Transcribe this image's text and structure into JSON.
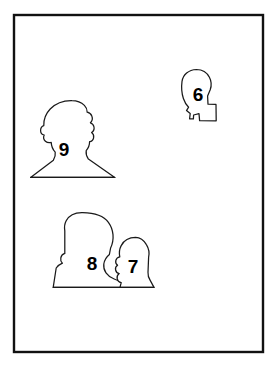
{
  "canvas": {
    "width": 276,
    "height": 366,
    "background_color": "#ffffff",
    "description": "Line-art illustration: four numbered human head-and-shoulder silhouettes inside a rectangular border"
  },
  "frame": {
    "name": "border-frame",
    "x": 14,
    "y": 15,
    "width": 249,
    "height": 337,
    "stroke_color": "#111111",
    "stroke_width": 2.4,
    "fill_color": "#ffffff"
  },
  "style": {
    "outline_color": "#1a1a1a",
    "outline_width": 1.25,
    "fill_color": "#ffffff",
    "label_color": "#000000",
    "label_font_size": 19
  },
  "figures": [
    {
      "id": "figure-6",
      "label": "6",
      "label_x": 198,
      "label_y": 96,
      "orientation": "profile-facing-right",
      "description": "small head in profile facing right, with stepped chin and neck",
      "bbox": {
        "x": 181,
        "y": 69,
        "width": 36,
        "height": 53
      },
      "path": "M 196.5 69.5 C 188.5 69.8 183.0 74.5 182.0 81.5 C 181.2 87.5 181.6 93.0 183.4 98.5 C 184.6 102.2 186.4 105.0 188.6 107.2 L 186.5 110.6 L 190.2 113.6 L 189.6 118.8 L 193.4 118.9 L 193.6 115.0 L 199.0 113.6 L 199.6 120.6 L 216.2 120.8 L 216.0 104.4 L 208.0 104.2 L 207.6 96.0 L 210.2 89.8 C 211.6 86.0 211.4 81.0 209.4 77.2 C 206.8 72.2 202.3 69.6 196.5 69.5 Z"
    },
    {
      "id": "figure-9",
      "label": "9",
      "label_x": 64,
      "label_y": 151,
      "orientation": "front-facing-bust",
      "description": "front-facing head and shoulders with wavy hair outline, flat baseline under shoulders",
      "bbox": {
        "x": 30,
        "y": 100,
        "width": 86,
        "height": 78
      },
      "path": "M 72.0 100.6 C 63.4 100.4 55.6 103.4 50.2 109.0 C 45.6 113.8 43.6 119.4 43.8 125.6 C 42.0 126.2 40.6 128.0 40.6 130.4 C 40.6 132.8 42.2 134.6 44.2 135.0 C 43.2 137.2 43.6 139.6 45.4 141.2 C 47.0 142.6 49.2 143.0 51.2 142.4 C 51.4 146.2 52.8 149.6 55.2 152.2 C 55.6 155.0 55.0 157.8 53.4 160.2 L 30.6 177.4 L 114.8 177.4 L 88.4 159.0 C 86.6 156.6 85.8 153.6 86.2 150.6 C 88.4 148.2 89.6 145.0 89.6 141.6 C 91.6 141.4 93.2 139.8 93.6 137.8 C 94.0 135.8 93.2 133.8 91.6 132.6 C 93.4 131.4 94.4 129.2 94.0 127.0 C 93.6 125.0 92.2 123.4 90.4 122.8 C 92.2 121.0 92.8 118.4 91.8 116.0 C 91.0 114.0 89.2 112.6 87.2 112.2 C 87.2 109.6 86.2 107.2 84.4 105.4 C 81.2 102.2 76.8 100.6 72.0 100.6 Z"
    },
    {
      "id": "figure-8",
      "label": "8",
      "label_x": 92,
      "label_y": 265,
      "orientation": "three-quarter-facing-right",
      "description": "larger head and shoulders, tall rounded head, facing slightly right, sharing baseline with figure 7",
      "bbox": {
        "x": 53,
        "y": 212,
        "width": 70,
        "height": 76
      },
      "path": "M 82.6 212.6 C 75.2 212.4 69.0 215.4 66.2 220.8 C 64.6 223.8 64.2 227.4 64.8 230.8 L 64.8 253.4 C 62.8 254.0 61.2 255.6 60.8 257.8 C 60.4 259.8 61.0 261.8 62.4 263.2 C 60.0 264.2 57.8 265.8 56.2 268.0 L 53.2 287.4 L 122.6 287.4 L 122.2 283.0 C 119.6 281.4 117.0 280.0 114.2 279.0 C 111.0 277.8 108.0 275.6 106.0 272.8 C 104.2 270.2 103.4 267.0 103.8 264.0 C 104.4 260.2 106.4 256.8 109.4 254.4 L 110.6 248.0 C 112.6 243.8 113.4 239.2 113.0 234.6 C 112.6 230.2 111.0 226.0 108.4 222.4 C 104.6 217.0 96.8 212.8 82.6 212.6 Z"
    },
    {
      "id": "figure-7",
      "label": "7",
      "label_x": 133,
      "label_y": 268,
      "orientation": "profile-facing-left",
      "description": "smaller head in profile facing left with wavy facial contour, shares baseline with figure 8",
      "bbox": {
        "x": 114,
        "y": 237,
        "width": 40,
        "height": 51
      },
      "path": "M 135.6 237.4 C 129.2 237.4 123.8 240.6 121.2 245.6 C 119.4 249.0 119.0 253.0 119.8 256.8 C 117.8 257.2 116.2 258.6 115.8 260.6 C 115.4 262.4 116.2 264.2 117.6 265.2 C 116.0 266.2 115.2 268.2 115.6 270.0 C 116.0 271.8 117.4 273.2 119.2 273.6 C 117.6 274.8 116.8 276.8 117.2 278.8 C 117.6 280.8 119.2 282.2 121.2 282.6 L 120.0 287.4 L 154.0 287.4 L 150.2 280.4 C 148.6 278.0 147.8 275.2 148.0 272.4 L 148.6 257.4 C 149.6 253.0 148.8 248.4 146.4 244.6 C 143.8 240.2 139.9 237.5 135.6 237.4 Z"
    }
  ],
  "ground_lines": [
    {
      "id": "ground-line-9",
      "x1": 30.6,
      "y1": 177.4,
      "x2": 114.8,
      "y2": 177.4
    },
    {
      "id": "ground-line-8-7",
      "x1": 53.2,
      "y1": 287.4,
      "x2": 154.0,
      "y2": 287.4
    }
  ]
}
